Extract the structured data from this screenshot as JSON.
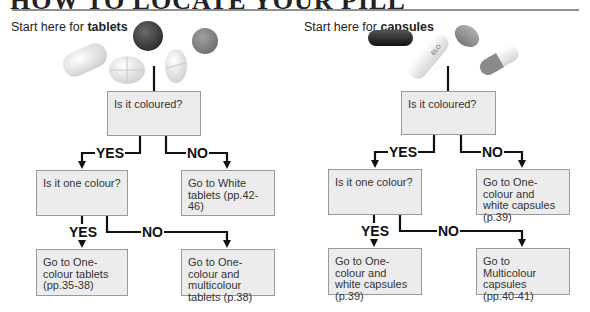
{
  "page": {
    "title": "HOW TO LOCATE YOUR PILL",
    "tablets": {
      "start_prefix": "Start here for ",
      "start_bold": "tablets",
      "q1": "Is it coloured?",
      "yes1": "YES",
      "no1": "NO",
      "q2": "Is it one colour?",
      "no1_result": "Go to White tablets (pp.42-46)",
      "yes2": "YES",
      "no2": "NO",
      "yes2_result": "Go to One-colour tablets (pp.35-38)",
      "no2_result": "Go to One-colour and multicolour tablets (p.38)"
    },
    "capsules": {
      "start_prefix": "Start here for ",
      "start_bold": "capsules",
      "q1": "Is it coloured?",
      "yes1": "YES",
      "no1": "NO",
      "q2": "Is it one colour?",
      "no1_result": "Go to One-colour and white capsules (p.39)",
      "yes2": "YES",
      "no2": "NO",
      "yes2_result": "Go to One-colour and white capsules (p.39)",
      "no2_result": "Go to Multicolour capsules (pp.40-41)",
      "capsule_imprint": "ELO"
    }
  }
}
